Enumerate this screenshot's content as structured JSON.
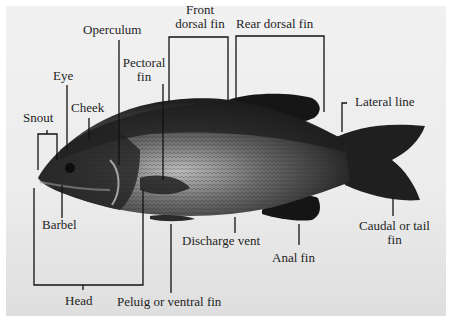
{
  "figure": {
    "labels": {
      "snout": "Snout",
      "eye": "Eye",
      "cheek": "Cheek",
      "operculum": "Operculum",
      "pectoral_fin_1": "Pectoral",
      "pectoral_fin_2": "fin",
      "front_dorsal_fin_1": "Front",
      "front_dorsal_fin_2": "dorsal fin",
      "rear_dorsal_fin": "Rear dorsal fin",
      "lateral_line": "Lateral line",
      "barbel": "Barbel",
      "discharge_vent": "Discharge vent",
      "anal_fin": "Anal fin",
      "caudal_fin_1": "Caudal or tail",
      "caudal_fin_2": "fin",
      "head": "Head",
      "pelvic_fin": "Peluig or ventral fin"
    },
    "colors": {
      "background": "#ececec",
      "fish_dark": "#1a1a1a",
      "fish_mid": "#4a4a4a",
      "fish_belly": "#bdbdbd",
      "lines": "#111111",
      "text": "#1e1e1e"
    }
  }
}
